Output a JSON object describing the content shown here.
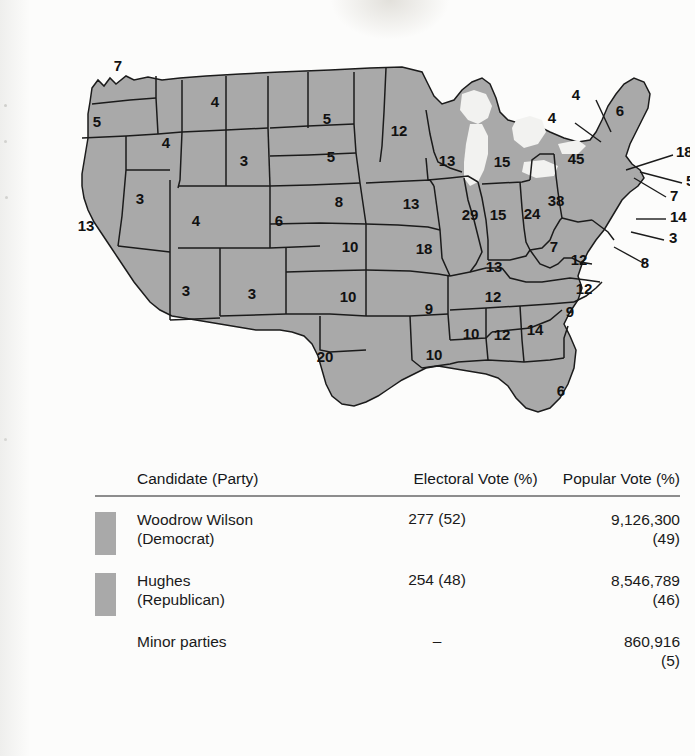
{
  "figure": {
    "kind": "electoral-map",
    "map_fill_color": "#a9a9a9",
    "water_color": "#f2f2f0",
    "border_color": "#1b1b1b"
  },
  "map": {
    "states": [
      {
        "code": "WA",
        "name": "Washington",
        "ev": "7",
        "x": 88,
        "y": 47
      },
      {
        "code": "OR",
        "name": "Oregon",
        "ev": "5",
        "x": 67,
        "y": 103
      },
      {
        "code": "CA",
        "name": "California",
        "ev": "13",
        "x": 56,
        "y": 207
      },
      {
        "code": "ID",
        "name": "Idaho",
        "ev": "4",
        "x": 136,
        "y": 124
      },
      {
        "code": "NV",
        "name": "Nevada",
        "ev": "3",
        "x": 110,
        "y": 180
      },
      {
        "code": "MT",
        "name": "Montana",
        "ev": "4",
        "x": 185,
        "y": 83
      },
      {
        "code": "WY",
        "name": "Wyoming",
        "ev": "3",
        "x": 214,
        "y": 142
      },
      {
        "code": "UT",
        "name": "Utah",
        "ev": "4",
        "x": 166,
        "y": 202
      },
      {
        "code": "AZ",
        "name": "Arizona",
        "ev": "3",
        "x": 156,
        "y": 272
      },
      {
        "code": "NM",
        "name": "New Mexico",
        "ev": "3",
        "x": 222,
        "y": 275
      },
      {
        "code": "CO",
        "name": "Colorado",
        "ev": "6",
        "x": 249,
        "y": 202
      },
      {
        "code": "ND",
        "name": "North Dakota",
        "ev": "5",
        "x": 297,
        "y": 100
      },
      {
        "code": "SD",
        "name": "South Dakota",
        "ev": "5",
        "x": 301,
        "y": 138
      },
      {
        "code": "NE",
        "name": "Nebraska",
        "ev": "8",
        "x": 309,
        "y": 183
      },
      {
        "code": "KS",
        "name": "Kansas",
        "ev": "10",
        "x": 320,
        "y": 228
      },
      {
        "code": "OK",
        "name": "Oklahoma",
        "ev": "10",
        "x": 318,
        "y": 278
      },
      {
        "code": "TX",
        "name": "Texas",
        "ev": "20",
        "x": 295,
        "y": 338
      },
      {
        "code": "MN",
        "name": "Minnesota",
        "ev": "12",
        "x": 369,
        "y": 112
      },
      {
        "code": "IA",
        "name": "Iowa",
        "ev": "13",
        "x": 381,
        "y": 185
      },
      {
        "code": "MO",
        "name": "Missouri",
        "ev": "18",
        "x": 394,
        "y": 230
      },
      {
        "code": "AR",
        "name": "Arkansas",
        "ev": "9",
        "x": 399,
        "y": 290
      },
      {
        "code": "LA",
        "name": "Louisiana",
        "ev": "10",
        "x": 404,
        "y": 336
      },
      {
        "code": "WI",
        "name": "Wisconsin",
        "ev": "13",
        "x": 417,
        "y": 142
      },
      {
        "code": "IL",
        "name": "Illinois",
        "ev": "29",
        "x": 440,
        "y": 196
      },
      {
        "code": "MS",
        "name": "Mississippi",
        "ev": "10",
        "x": 441,
        "y": 315
      },
      {
        "code": "MI",
        "name": "Michigan",
        "ev": "15",
        "x": 472,
        "y": 143
      },
      {
        "code": "IN",
        "name": "Indiana",
        "ev": "15",
        "x": 468,
        "y": 196
      },
      {
        "code": "KY",
        "name": "Kentucky",
        "ev": "13",
        "x": 464,
        "y": 248
      },
      {
        "code": "TN",
        "name": "Tennessee",
        "ev": "12",
        "x": 463,
        "y": 278
      },
      {
        "code": "AL",
        "name": "Alabama",
        "ev": "12",
        "x": 472,
        "y": 316
      },
      {
        "code": "OH",
        "name": "Ohio",
        "ev": "24",
        "x": 502,
        "y": 195
      },
      {
        "code": "GA",
        "name": "Georgia",
        "ev": "14",
        "x": 505,
        "y": 311
      },
      {
        "code": "FL",
        "name": "Florida",
        "ev": "6",
        "x": 531,
        "y": 372
      },
      {
        "code": "WV",
        "name": "West Virginia",
        "ev": "7",
        "x": 524,
        "y": 228
      },
      {
        "code": "VA",
        "name": "Virginia",
        "ev": "12",
        "x": 549,
        "y": 241
      },
      {
        "code": "NC",
        "name": "North Carolina",
        "ev": "12",
        "x": 554,
        "y": 270
      },
      {
        "code": "SC",
        "name": "South Carolina",
        "ev": "9",
        "x": 540,
        "y": 293
      },
      {
        "code": "PA",
        "name": "Pennsylvania",
        "ev": "38",
        "x": 526,
        "y": 182
      },
      {
        "code": "NY",
        "name": "New York",
        "ev": "45",
        "x": 546,
        "y": 140
      },
      {
        "code": "ME",
        "name": "Maine",
        "ev": "6",
        "x": 590,
        "y": 92
      }
    ],
    "callouts": [
      {
        "code": "VT",
        "name": "Vermont",
        "ev": "4",
        "lx": 526,
        "ly": 99,
        "x1": 545,
        "y1": 103,
        "x2": 571,
        "y2": 122
      },
      {
        "code": "NH",
        "name": "New Hampshire",
        "ev": "4",
        "lx": 550,
        "ly": 76,
        "x1": 566,
        "y1": 80,
        "x2": 581,
        "y2": 112
      },
      {
        "code": "MA",
        "name": "Massachusetts",
        "ev": "18",
        "lx": 646,
        "ly": 133,
        "x1": 643,
        "y1": 135,
        "x2": 596,
        "y2": 150
      },
      {
        "code": "RI",
        "name": "Rhode Island",
        "ev": "5",
        "lx": 656,
        "ly": 162,
        "x1": 652,
        "y1": 163,
        "x2": 610,
        "y2": 152
      },
      {
        "code": "CT",
        "name": "Connecticut",
        "ev": "7",
        "lx": 640,
        "ly": 177,
        "x1": 636,
        "y1": 177,
        "x2": 604,
        "y2": 158
      },
      {
        "code": "NJ",
        "name": "New Jersey",
        "ev": "14",
        "lx": 640,
        "ly": 198,
        "x1": 636,
        "y1": 199,
        "x2": 606,
        "y2": 199
      },
      {
        "code": "DE",
        "name": "Delaware",
        "ly": 219,
        "ev": "3",
        "lx": 639,
        "x1": 634,
        "y1": 220,
        "x2": 601,
        "y2": 212
      },
      {
        "code": "MD",
        "name": "Maryland",
        "ev": "8",
        "lx": 619,
        "ly": 244,
        "x1": 615,
        "y1": 244,
        "x2": 584,
        "y2": 227
      }
    ]
  },
  "results": {
    "headers": {
      "candidate": "Candidate (Party)",
      "electoral": "Electoral Vote (%)",
      "popular": "Popular Vote (%)"
    },
    "rows": [
      {
        "swatch": "#a9a9a9",
        "has_swatch": true,
        "candidate": "Woodrow Wilson",
        "party": "(Democrat)",
        "electoral": "277 (52)",
        "popular": "9,126,300",
        "popular_pct": "(49)"
      },
      {
        "swatch": "#a9a9a9",
        "has_swatch": true,
        "candidate": "Hughes",
        "party": "(Republican)",
        "electoral": "254 (48)",
        "popular": "8,546,789",
        "popular_pct": "(46)"
      },
      {
        "swatch": "",
        "has_swatch": false,
        "candidate": "Minor parties",
        "party": "",
        "electoral": "–",
        "popular": "860,916",
        "popular_pct": "(5)"
      }
    ]
  }
}
